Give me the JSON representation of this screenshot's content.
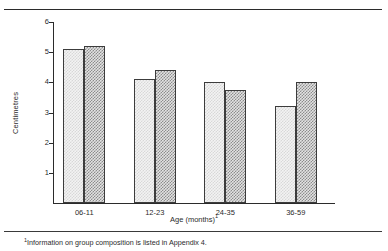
{
  "chart_data": {
    "type": "bar",
    "title": "",
    "subtitle": "",
    "categories": [
      "06-11",
      "12-23",
      "24-35",
      "36-59"
    ],
    "series": [
      {
        "name": "series-1-light",
        "values": [
          5.1,
          4.1,
          4.0,
          3.2
        ],
        "fill": "light-stipple",
        "color": "#f3f3f3"
      },
      {
        "name": "series-2-dark",
        "values": [
          5.2,
          4.4,
          3.75,
          4.0
        ],
        "fill": "dark-checker",
        "color": "#8c8c8c"
      }
    ],
    "xlabel": "Age (months)",
    "xlabel_footnote_marker": "1",
    "ylabel": "Centimetres",
    "ylim": [
      0,
      6
    ],
    "yticks": [
      1,
      2,
      3,
      4,
      5,
      6
    ],
    "ytick_labels": [
      "1",
      "2",
      "3",
      "4",
      "5",
      "6"
    ],
    "grid": false,
    "legend": "none"
  },
  "footnote": {
    "marker": "1",
    "text": "Information on group composition is listed in Appendix 4."
  },
  "colors": {
    "axis": "#2b2b2b",
    "rule": "#2b2b2b",
    "bar_light": "#f3f3f3",
    "bar_dark": "#8c8c8c",
    "text": "#2b2b2b"
  }
}
